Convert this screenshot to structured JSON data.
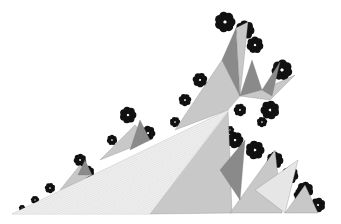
{
  "image": {
    "width": 341,
    "height": 224,
    "background": "#ffffff",
    "description": "Grayscale fractal illustration of faceted triangular spikes rising to the upper right with dark Julia-set-like fringes",
    "palette": {
      "black": "#111111",
      "dark": "#3a3a3a",
      "mid": "#8a8a8a",
      "light": "#c8c8c8",
      "pale": "#e6e6e6",
      "hatch": "#bdbdbd"
    },
    "base_wedge": [
      [
        12,
        214
      ],
      [
        228,
        110
      ],
      [
        240,
        96
      ],
      [
        150,
        214
      ]
    ],
    "facets": [
      {
        "pts": [
          [
            12,
            214
          ],
          [
            228,
            110
          ],
          [
            150,
            214
          ]
        ],
        "fill": "pale"
      },
      {
        "pts": [
          [
            150,
            214
          ],
          [
            228,
            110
          ],
          [
            232,
            213
          ]
        ],
        "fill": "light"
      },
      {
        "pts": [
          [
            175,
            130
          ],
          [
            222,
            60
          ],
          [
            240,
            96
          ],
          [
            228,
            110
          ]
        ],
        "fill": "light"
      },
      {
        "pts": [
          [
            222,
            60
          ],
          [
            236,
            28
          ],
          [
            240,
            96
          ]
        ],
        "fill": "mid"
      },
      {
        "pts": [
          [
            236,
            28
          ],
          [
            248,
            22
          ],
          [
            240,
            96
          ]
        ],
        "fill": "light"
      },
      {
        "pts": [
          [
            240,
            96
          ],
          [
            252,
            60
          ],
          [
            262,
            90
          ]
        ],
        "fill": "mid"
      },
      {
        "pts": [
          [
            240,
            96
          ],
          [
            262,
            90
          ],
          [
            295,
            75
          ],
          [
            270,
            100
          ]
        ],
        "fill": "light"
      },
      {
        "pts": [
          [
            262,
            90
          ],
          [
            280,
            62
          ],
          [
            272,
            96
          ]
        ],
        "fill": "mid"
      },
      {
        "pts": [
          [
            230,
            213
          ],
          [
            275,
            150
          ],
          [
            282,
            213
          ]
        ],
        "fill": "light"
      },
      {
        "pts": [
          [
            255,
            190
          ],
          [
            298,
            160
          ],
          [
            285,
            213
          ]
        ],
        "fill": "pale"
      },
      {
        "pts": [
          [
            285,
            213
          ],
          [
            305,
            185
          ],
          [
            318,
            213
          ]
        ],
        "fill": "light"
      },
      {
        "pts": [
          [
            220,
            170
          ],
          [
            245,
            140
          ],
          [
            240,
            200
          ]
        ],
        "fill": "mid"
      },
      {
        "pts": [
          [
            100,
            160
          ],
          [
            135,
            125
          ],
          [
            150,
            140
          ]
        ],
        "fill": "light"
      },
      {
        "pts": [
          [
            130,
            150
          ],
          [
            140,
            120
          ],
          [
            150,
            140
          ]
        ],
        "fill": "mid"
      },
      {
        "pts": [
          [
            60,
            190
          ],
          [
            80,
            165
          ],
          [
            92,
            175
          ]
        ],
        "fill": "light"
      },
      {
        "pts": [
          [
            78,
            175
          ],
          [
            85,
            160
          ],
          [
            92,
            175
          ]
        ],
        "fill": "mid"
      }
    ],
    "fringes": [
      {
        "cx": 225,
        "cy": 22,
        "r": 10
      },
      {
        "cx": 245,
        "cy": 30,
        "r": 9
      },
      {
        "cx": 255,
        "cy": 45,
        "r": 8
      },
      {
        "cx": 282,
        "cy": 70,
        "r": 10
      },
      {
        "cx": 270,
        "cy": 110,
        "r": 9
      },
      {
        "cx": 240,
        "cy": 110,
        "r": 6
      },
      {
        "cx": 200,
        "cy": 80,
        "r": 7
      },
      {
        "cx": 185,
        "cy": 100,
        "r": 6
      },
      {
        "cx": 175,
        "cy": 122,
        "r": 5
      },
      {
        "cx": 128,
        "cy": 115,
        "r": 8
      },
      {
        "cx": 148,
        "cy": 133,
        "r": 7
      },
      {
        "cx": 112,
        "cy": 140,
        "r": 5
      },
      {
        "cx": 80,
        "cy": 160,
        "r": 6
      },
      {
        "cx": 88,
        "cy": 172,
        "r": 6
      },
      {
        "cx": 50,
        "cy": 188,
        "r": 5
      },
      {
        "cx": 35,
        "cy": 200,
        "r": 4
      },
      {
        "cx": 22,
        "cy": 208,
        "r": 3
      },
      {
        "cx": 235,
        "cy": 140,
        "r": 8
      },
      {
        "cx": 255,
        "cy": 150,
        "r": 9
      },
      {
        "cx": 275,
        "cy": 160,
        "r": 8
      },
      {
        "cx": 290,
        "cy": 175,
        "r": 8
      },
      {
        "cx": 305,
        "cy": 190,
        "r": 8
      },
      {
        "cx": 318,
        "cy": 205,
        "r": 7
      },
      {
        "cx": 300,
        "cy": 195,
        "r": 6
      },
      {
        "cx": 230,
        "cy": 130,
        "r": 4
      },
      {
        "cx": 262,
        "cy": 122,
        "r": 5
      }
    ]
  }
}
